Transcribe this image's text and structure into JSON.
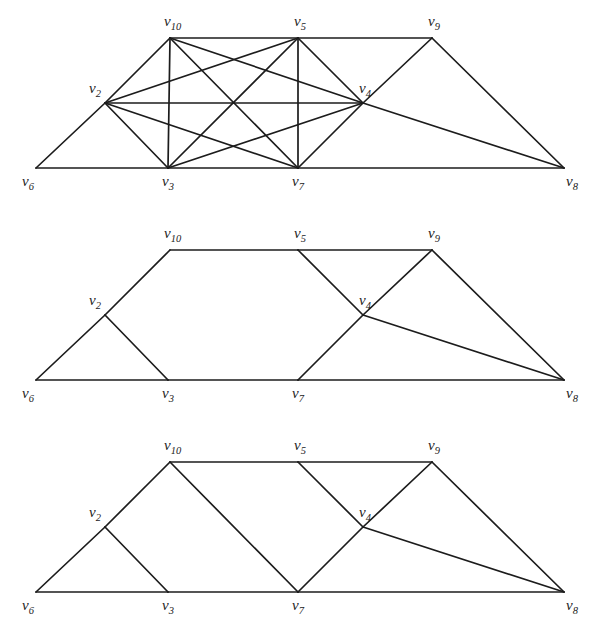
{
  "figure": {
    "background_color": "#ffffff",
    "edge_color": "#1c1c1c",
    "label_color": "#1b1b1b"
  },
  "vertex_labels": {
    "v2": "v",
    "v2_sub": "2",
    "v3": "v",
    "v3_sub": "3",
    "v4": "v",
    "v4_sub": "4",
    "v5": "v",
    "v5_sub": "5",
    "v6": "v",
    "v6_sub": "6",
    "v7": "v",
    "v7_sub": "7",
    "v8": "v",
    "v8_sub": "8",
    "v9": "v",
    "v9_sub": "9",
    "v10": "v",
    "v10_sub": "10"
  },
  "chart_data": {
    "type": "diagram",
    "subtype": "node-link-graph",
    "shared_vertex_positions": {
      "v6": [
        36,
        168
      ],
      "v3": [
        168,
        168
      ],
      "v7": [
        298,
        168
      ],
      "v8": [
        564,
        168
      ],
      "v2": [
        105,
        103
      ],
      "v4": [
        363,
        103
      ],
      "v10": [
        170,
        38
      ],
      "v5": [
        298,
        38
      ],
      "v9": [
        432,
        38
      ]
    },
    "label_offsets": {
      "v6": [
        -14,
        18
      ],
      "v3": [
        -6,
        18
      ],
      "v7": [
        -6,
        18
      ],
      "v8": [
        2,
        18
      ],
      "v2": [
        -16,
        -10
      ],
      "v4": [
        -4,
        -10
      ],
      "v10": [
        -6,
        -12
      ],
      "v5": [
        -4,
        -12
      ],
      "v9": [
        -4,
        -12
      ]
    },
    "graphs": [
      {
        "index": 1,
        "name": "graph-top",
        "description": "Dense graph: outer trapezoid plus complete subgraph on v2,v3,v10,v5,v7,v4",
        "edge_count": 22,
        "edges": [
          [
            "v6",
            "v3"
          ],
          [
            "v3",
            "v7"
          ],
          [
            "v7",
            "v8"
          ],
          [
            "v6",
            "v2"
          ],
          [
            "v2",
            "v10"
          ],
          [
            "v10",
            "v5"
          ],
          [
            "v5",
            "v9"
          ],
          [
            "v9",
            "v8"
          ],
          [
            "v2",
            "v3"
          ],
          [
            "v2",
            "v10"
          ],
          [
            "v2",
            "v4"
          ],
          [
            "v2",
            "v5"
          ],
          [
            "v2",
            "v7"
          ],
          [
            "v10",
            "v3"
          ],
          [
            "v10",
            "v7"
          ],
          [
            "v10",
            "v4"
          ],
          [
            "v3",
            "v5"
          ],
          [
            "v3",
            "v4"
          ],
          [
            "v5",
            "v7"
          ],
          [
            "v5",
            "v4"
          ],
          [
            "v7",
            "v4"
          ],
          [
            "v4",
            "v9"
          ],
          [
            "v4",
            "v8"
          ]
        ]
      },
      {
        "index": 2,
        "name": "graph-middle",
        "description": "Sparser graph: trapezoid outline with triangles at v2,v3 and at v4",
        "edge_count": 13,
        "edges": [
          [
            "v6",
            "v3"
          ],
          [
            "v3",
            "v7"
          ],
          [
            "v7",
            "v8"
          ],
          [
            "v6",
            "v2"
          ],
          [
            "v2",
            "v10"
          ],
          [
            "v10",
            "v5"
          ],
          [
            "v5",
            "v9"
          ],
          [
            "v9",
            "v8"
          ],
          [
            "v2",
            "v3"
          ],
          [
            "v5",
            "v4"
          ],
          [
            "v4",
            "v7"
          ],
          [
            "v4",
            "v9"
          ],
          [
            "v4",
            "v8"
          ]
        ]
      },
      {
        "index": 3,
        "name": "graph-bottom",
        "description": "Same as middle graph plus the v10-v7 diagonal",
        "edge_count": 14,
        "edges": [
          [
            "v6",
            "v3"
          ],
          [
            "v3",
            "v7"
          ],
          [
            "v7",
            "v8"
          ],
          [
            "v6",
            "v2"
          ],
          [
            "v2",
            "v10"
          ],
          [
            "v10",
            "v5"
          ],
          [
            "v5",
            "v9"
          ],
          [
            "v9",
            "v8"
          ],
          [
            "v2",
            "v3"
          ],
          [
            "v10",
            "v7"
          ],
          [
            "v5",
            "v4"
          ],
          [
            "v4",
            "v7"
          ],
          [
            "v4",
            "v9"
          ],
          [
            "v4",
            "v8"
          ]
        ]
      }
    ]
  }
}
